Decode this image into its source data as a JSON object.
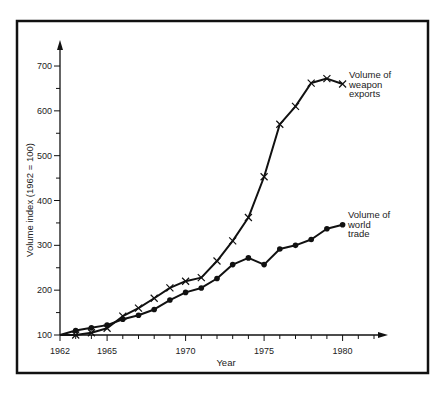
{
  "chart_data": {
    "type": "line",
    "title": "",
    "xlabel": "Year",
    "ylabel": "Volume index (1962 = 100)",
    "xlim": [
      1962,
      1982
    ],
    "ylim": [
      100,
      750
    ],
    "x_ticks": [
      1962,
      1965,
      1970,
      1975,
      1980
    ],
    "y_ticks": [
      100,
      200,
      300,
      400,
      500,
      600,
      700
    ],
    "grid": false,
    "legend": "inline labels at line ends",
    "x": [
      1962,
      1963,
      1964,
      1965,
      1966,
      1967,
      1968,
      1969,
      1970,
      1971,
      1972,
      1973,
      1974,
      1975,
      1976,
      1977,
      1978,
      1979,
      1980
    ],
    "series": [
      {
        "name": "Volume of weapon exports",
        "label_lines": [
          "Volume of",
          "weapon",
          "exports"
        ],
        "marker": "x",
        "values": [
          100,
          100,
          105,
          115,
          142,
          160,
          182,
          205,
          220,
          228,
          265,
          310,
          362,
          453,
          570,
          610,
          662,
          672,
          660
        ]
      },
      {
        "name": "Volume of world trade",
        "label_lines": [
          "Volume of",
          "world",
          "trade"
        ],
        "marker": "dot",
        "values": [
          100,
          110,
          116,
          122,
          135,
          144,
          157,
          178,
          195,
          205,
          226,
          257,
          272,
          257,
          292,
          300,
          313,
          337,
          346
        ]
      }
    ]
  },
  "colors": {
    "line": "#111111",
    "frame": "#111111",
    "background": "#ffffff"
  }
}
